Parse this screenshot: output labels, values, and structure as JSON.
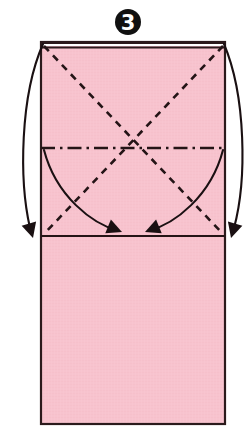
{
  "diagram": {
    "kind": "origami-fold-instruction",
    "step_number": "3",
    "step_badge": {
      "shape": "filled-circle",
      "center_x": 128,
      "center_y": 22,
      "outer_radius": 13,
      "inner_radius": 10.5,
      "fill_color": "#111111",
      "numeral_color": "#ffffff"
    },
    "colors": {
      "paper_fill": "#f7c3ce",
      "paper_fill_shade": "#f4bcc8",
      "paper_edge": "#2b1a1c",
      "crease_line": "#241416",
      "arrow_line": "#1a1012",
      "background": "#ffffff"
    },
    "paper": {
      "label": "pink rectangular paper",
      "left": 41,
      "top": 42,
      "right": 225,
      "bottom": 424,
      "width": 184,
      "height": 382,
      "edge_width": 2.2
    },
    "folded_top_edge": {
      "label": "doubled folded top edge",
      "band_top": 42,
      "band_bottom": 47.5,
      "gap_color": "#ffffff"
    },
    "upper_panel": {
      "label": "upper square panel",
      "top": 42,
      "bottom": 236,
      "left": 41,
      "right": 225
    },
    "creases": [
      {
        "name": "diagonal-crease-tl-br",
        "style": "dashed",
        "meaning": "valley fold",
        "x1": 44,
        "y1": 46,
        "x2": 223,
        "y2": 234
      },
      {
        "name": "diagonal-crease-tr-bl",
        "style": "dashed",
        "meaning": "valley fold",
        "x1": 223,
        "y1": 46,
        "x2": 44,
        "y2": 234
      },
      {
        "name": "horizontal-center-crease",
        "style": "dash-dot",
        "meaning": "mountain fold",
        "x1": 41,
        "y1": 148,
        "x2": 225,
        "y2": 148
      },
      {
        "name": "horizontal-fold-edge",
        "style": "solid",
        "meaning": "existing folded edge",
        "x1": 41,
        "y1": 236,
        "x2": 225,
        "y2": 236
      }
    ],
    "arrows": [
      {
        "name": "inner-fold-arrow-left",
        "description": "curved arrow from left edge midline sweeping down-right to the fold line",
        "path": "M 44 150 C 56 196 92 224 119 231",
        "arrowhead_at": {
          "x": 122,
          "y": 232
        },
        "arrowhead_angle_deg": 22
      },
      {
        "name": "inner-fold-arrow-right",
        "description": "curved arrow from right edge midline sweeping down-left to the fold line",
        "path": "M 223 150 C 211 196 175 224 148 231",
        "arrowhead_at": {
          "x": 145,
          "y": 232
        },
        "arrowhead_angle_deg": 158
      },
      {
        "name": "outer-fold-arrow-left",
        "description": "long arc outside the paper on the left, from top corner down to the fold line",
        "path": "M 43 44 C 20 96 19 180 30 228",
        "arrowhead_at": {
          "x": 33,
          "y": 238
        },
        "arrowhead_angle_deg": 74
      },
      {
        "name": "outer-fold-arrow-right",
        "description": "long arc outside the paper on the right, from top corner down to the fold line",
        "path": "M 224 44 C 246 96 247 180 234 228",
        "arrowhead_at": {
          "x": 231,
          "y": 238
        },
        "arrowhead_angle_deg": 106
      }
    ],
    "arrowhead": {
      "length": 15,
      "half_width": 7.5,
      "fill_color": "#1a1012"
    }
  }
}
